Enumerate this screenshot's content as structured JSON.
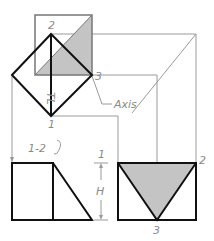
{
  "diagram": {
    "type": "orthographic auxiliary view construction",
    "colors": {
      "heavy_line": "#111111",
      "light_line": "#9a9a9a",
      "shade": "#c4c4c4",
      "label": "#8a8a8a"
    },
    "labels": {
      "top_point_2": "2",
      "top_point_3": "3",
      "top_point_1": "1",
      "true_length": "TL",
      "axis": "Axis",
      "front_edge": "1-2",
      "dim_1": "1",
      "dim_h": "H",
      "right_point_2": "2",
      "right_point_3": "3"
    }
  }
}
